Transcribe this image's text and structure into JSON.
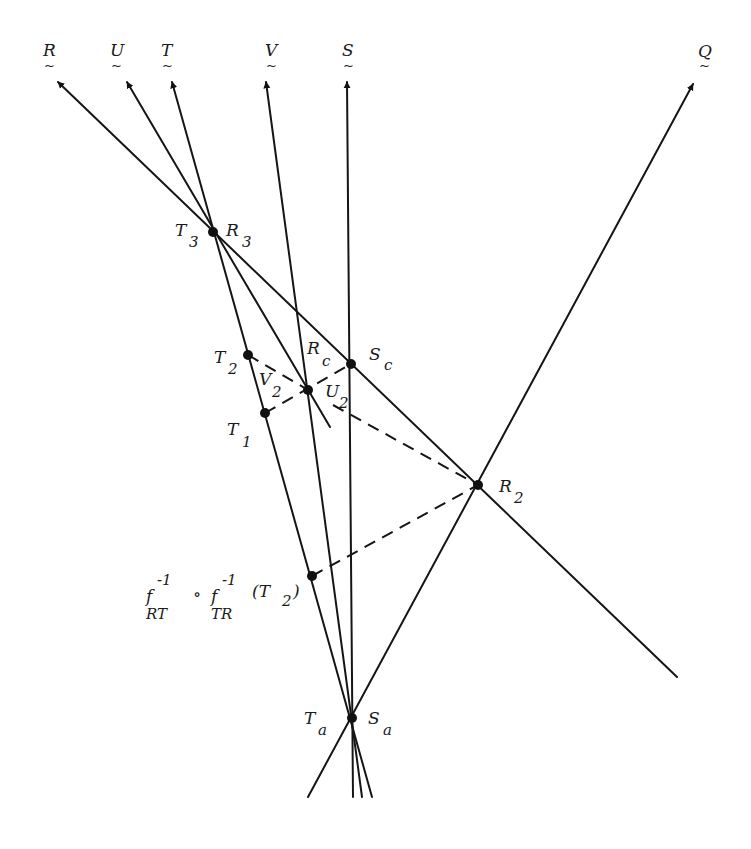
{
  "diagram": {
    "rays": [
      {
        "id": "R",
        "label": "R",
        "decoration": "~"
      },
      {
        "id": "U",
        "label": "U",
        "decoration": "~"
      },
      {
        "id": "T",
        "label": "T",
        "decoration": "~"
      },
      {
        "id": "V",
        "label": "V",
        "decoration": "~"
      },
      {
        "id": "S",
        "label": "S",
        "decoration": "~"
      },
      {
        "id": "Q",
        "label": "Q",
        "decoration": "~"
      }
    ],
    "points": {
      "T3": {
        "main": "T",
        "sub": "3"
      },
      "R3": {
        "main": "R",
        "sub": "3"
      },
      "T2": {
        "main": "T",
        "sub": "2"
      },
      "V2": {
        "main": "V",
        "sub": "2"
      },
      "Rc": {
        "main": "R",
        "sub": "c"
      },
      "U2": {
        "main": "U",
        "sub": "2"
      },
      "Sc": {
        "main": "S",
        "sub": "c"
      },
      "T1": {
        "main": "T",
        "sub": "1"
      },
      "R2": {
        "main": "R",
        "sub": "2"
      },
      "Ta": {
        "main": "T",
        "sub": "a"
      },
      "Sa": {
        "main": "S",
        "sub": "a"
      }
    },
    "formula": {
      "f1": "f",
      "sup1": "-1",
      "sub1": "RT",
      "compose": "∘",
      "f2": "f",
      "sup2": "-1",
      "sub2": "TR",
      "arg_open": "(T",
      "arg_sub": "2",
      "arg_close": ")"
    }
  }
}
